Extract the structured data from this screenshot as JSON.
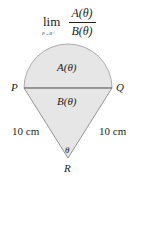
{
  "formula": {
    "lim": "lim",
    "subscript": "θ→0⁺",
    "numerator": "A(θ)",
    "denominator": "B(θ)"
  },
  "figure": {
    "fill_color": "#e6e6e6",
    "stroke_color": "#8a8a8a",
    "chord_color": "#7a7a7a",
    "region_top_label": "A(θ)",
    "region_bottom_label": "B(θ)",
    "point_left": "P",
    "point_right": "Q",
    "point_apex": "R",
    "angle_label": "θ",
    "side_left_label": "10 cm",
    "side_right_label": "10 cm"
  }
}
